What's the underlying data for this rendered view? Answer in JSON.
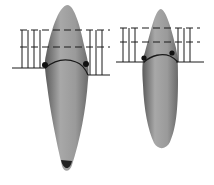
{
  "figure": {
    "colors": {
      "background": "#ffffff",
      "tooth_fill": "#9a9a9a",
      "tooth_dark": "#4a4a4a",
      "line": "#1a1a1a"
    },
    "teeth": [
      {
        "name": "left-tooth",
        "marker_points": 2
      },
      {
        "name": "right-tooth",
        "marker_points": 2
      }
    ]
  }
}
